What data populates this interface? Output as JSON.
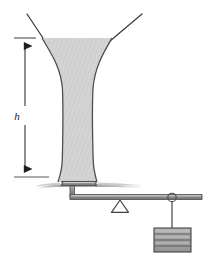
{
  "figure": {
    "domain": "Diagram",
    "width": 209,
    "height": 255,
    "background_color": "#ffffff"
  },
  "labels": {
    "height_symbol": "h"
  },
  "colors": {
    "outline": "#3a3a3a",
    "jet_fill": "#d2d2d2",
    "jet_hatch": "#c2c2c2",
    "jet_edge": "#4a4a4a",
    "lever": "#808080",
    "lever_edge": "#555555",
    "weight_fill": "#a8a8a8",
    "weight_edge": "#4a4a4a",
    "splash": "#b9b9b9",
    "dimension_line": "#2b2b2b",
    "ground_tick": "#5a5a5a",
    "string": "#6a6a6a"
  },
  "elements": {
    "nozzle": {
      "name": "funnel-nozzle",
      "left_wall_top_x": 27,
      "left_wall_top_y": 14,
      "right_wall_top_x": 142,
      "right_wall_top_y": 14,
      "mouth_left_x": 42,
      "mouth_right_x": 112,
      "mouth_y": 38
    },
    "jet": {
      "name": "water-jet",
      "top_y": 38,
      "bottom_y": 182,
      "top_left_x": 42,
      "top_right_x": 112,
      "throat_left_x": 62,
      "throat_right_x": 93,
      "throat_y": 88,
      "impact_left_x": 60,
      "impact_right_x": 95
    },
    "dimension": {
      "name": "height-dimension",
      "x": 25,
      "top_y": 38,
      "bottom_y": 177,
      "tick_top_x1": 14,
      "tick_top_x2": 36,
      "tick_bottom_x1": 14,
      "tick_bottom_x2": 48,
      "label_x": 17,
      "label_y": 116
    },
    "plate": {
      "name": "impact-plate",
      "x": 62,
      "y": 182,
      "width": 34,
      "height": 4
    },
    "splash": {
      "name": "splash-spray",
      "left_extent_x": 34,
      "right_extent_x": 148,
      "y": 186
    },
    "lever": {
      "name": "lever-beam",
      "left_x": 70,
      "right_x": 202,
      "y": 196,
      "thickness": 5,
      "stem_x": 72,
      "stem_top_y": 186,
      "stem_bottom_y": 197
    },
    "fulcrum": {
      "name": "fulcrum-triangle",
      "apex_x": 120,
      "apex_y": 199,
      "base_left_x": 112,
      "base_right_x": 128,
      "base_y": 212
    },
    "hanger": {
      "name": "weight-hanger-ring",
      "cx": 172,
      "cy": 198,
      "r": 4,
      "string_x": 172,
      "string_top_y": 202,
      "string_bottom_y": 228
    },
    "weight": {
      "name": "hanging-weight",
      "x": 154,
      "y": 228,
      "width": 37,
      "height": 24,
      "division_count": 3
    }
  }
}
